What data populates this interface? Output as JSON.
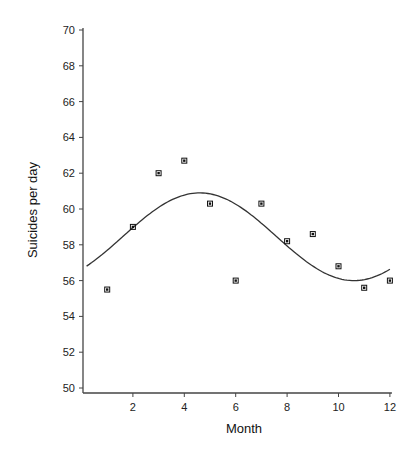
{
  "chart_data": {
    "type": "scatter",
    "title": "",
    "xlabel": "Month",
    "ylabel": "Suicides per day",
    "xlim": [
      0,
      12
    ],
    "ylim": [
      50,
      70
    ],
    "grid": false,
    "legend": null,
    "x_ticks": [
      2,
      4,
      6,
      8,
      10,
      12
    ],
    "y_ticks": [
      50,
      52,
      54,
      56,
      58,
      60,
      62,
      64,
      66,
      68,
      70
    ],
    "series": [
      {
        "name": "observed",
        "type": "scatter",
        "marker": "asterisk",
        "x": [
          1,
          2,
          3,
          4,
          5,
          6,
          7,
          8,
          9,
          10,
          11,
          12
        ],
        "values": [
          55.5,
          59.0,
          62.0,
          62.7,
          60.3,
          56.0,
          60.3,
          58.2,
          58.6,
          56.8,
          55.6,
          56.0
        ]
      },
      {
        "name": "fitted sinusoid",
        "type": "line",
        "x_range": [
          0.2,
          12
        ],
        "mean": 58.45,
        "amplitude": 2.45,
        "peak_month": 4.6,
        "period": 12
      }
    ]
  },
  "labels": {
    "xlabel": "Month",
    "ylabel": "Suicides per day"
  }
}
